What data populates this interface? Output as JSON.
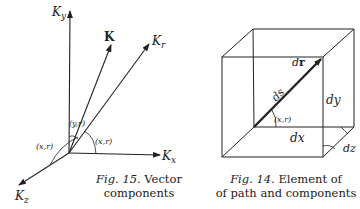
{
  "fig15": {
    "axis_labels": {
      "ky": "K",
      "ky_sub": "y",
      "kx": "K",
      "kx_sub": "x",
      "kz": "K",
      "kz_sub": "z",
      "kr": "K",
      "kr_sub": "r",
      "k_vector": "K"
    },
    "angle_labels": {
      "yr": "(y,r)",
      "xr_right": "(x,r)",
      "xr_left": "(x,r)"
    },
    "caption": {
      "fig": "Fig. 15.",
      "line1": "Vector",
      "line2": "components"
    }
  },
  "fig14": {
    "labels": {
      "dr_vec": "d",
      "dr_vec_bold": "r",
      "ds": "ds",
      "dy": "dy",
      "dx": "dx",
      "dz": "dz",
      "angle": "(x,r)"
    },
    "caption": {
      "fig": "Fig. 14.",
      "line1": "Element of",
      "line2": "of path and components"
    }
  },
  "colors": {
    "ink": "#222222",
    "background": "#ffffff"
  }
}
